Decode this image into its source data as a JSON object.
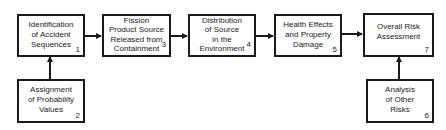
{
  "diagram": {
    "boxes": [
      {
        "id": 1,
        "label": "Identification\nof Accident\nSequences",
        "number": "1"
      },
      {
        "id": 2,
        "label": "Assignment\nof Probability\nValues",
        "number": "2"
      },
      {
        "id": 3,
        "label": "Fission\nProduct Source\nReleased from\nContainment",
        "number": "3"
      },
      {
        "id": 4,
        "label": "Distribution\nof Source\nin the\nEnvironment",
        "number": "4"
      },
      {
        "id": 5,
        "label": "Health Effects\nand Property\nDamage",
        "number": "5"
      },
      {
        "id": 6,
        "label": "Analysis\nof Other\nRisks",
        "number": "6"
      },
      {
        "id": 7,
        "label": "Overall Risk\nAssessment",
        "number": "7"
      }
    ],
    "edges": [
      {
        "from": 1,
        "to": 3
      },
      {
        "from": 2,
        "to": 1
      },
      {
        "from": 3,
        "to": 4
      },
      {
        "from": 4,
        "to": 5
      },
      {
        "from": 5,
        "to": 7
      },
      {
        "from": 6,
        "to": 7
      }
    ]
  }
}
